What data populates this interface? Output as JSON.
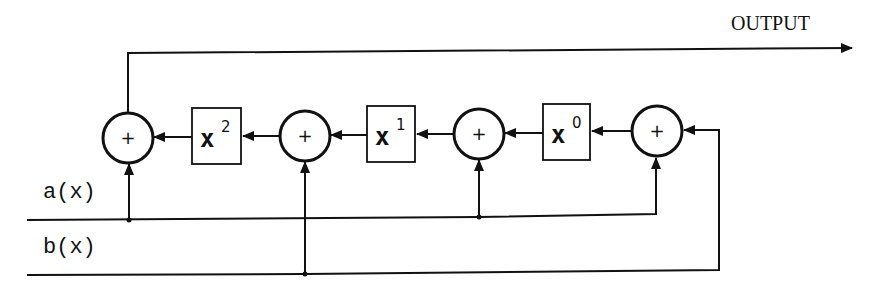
{
  "diagram": {
    "output_label": "OUTPUT",
    "inputs": [
      {
        "name": "a",
        "label": "a(x)"
      },
      {
        "name": "b",
        "label": "b(x)"
      }
    ],
    "adders": [
      {
        "id": "adder-1",
        "symbol": "+"
      },
      {
        "id": "adder-2",
        "symbol": "+"
      },
      {
        "id": "adder-3",
        "symbol": "+"
      },
      {
        "id": "adder-4",
        "symbol": "+"
      }
    ],
    "multipliers": [
      {
        "id": "mult-x2",
        "base": "x",
        "exponent": "2"
      },
      {
        "id": "mult-x1",
        "base": "x",
        "exponent": "1"
      },
      {
        "id": "mult-x0",
        "base": "x",
        "exponent": "0"
      }
    ],
    "colors": {
      "ink": "#111111",
      "background": "#ffffff"
    }
  }
}
